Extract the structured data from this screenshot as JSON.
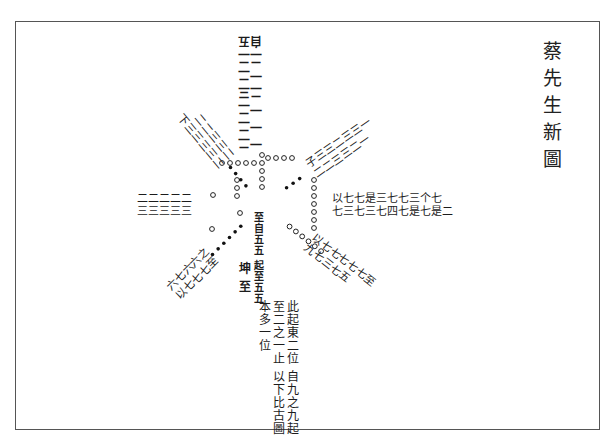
{
  "document": {
    "title": "蔡先生新圖",
    "title_chars": [
      "蔡",
      "先",
      "生",
      "新",
      "圖"
    ],
    "description": "Radial diagram with eight arms of handwritten classical Chinese annotations radiating from a central region marked by rows of circles and dots",
    "arms": [
      {
        "id": "north",
        "direction": "up",
        "marker": "circles",
        "lines": [
          "五二二三二二二",
          "自二一二一一一"
        ]
      },
      {
        "id": "northeast",
        "direction": "up-right",
        "marker": "dots",
        "lines": [
          "子三三二三三一",
          "二二三三二一"
        ]
      },
      {
        "id": "east",
        "direction": "right",
        "marker": "circles",
        "lines": [
          "以七七是三七七三个七",
          "七三七三七四七是七是二"
        ]
      },
      {
        "id": "southeast",
        "direction": "down-right",
        "marker": "circles",
        "lines": [
          "以七七七七七至",
          "九七三七五"
        ]
      },
      {
        "id": "south",
        "direction": "down",
        "marker": "circles",
        "lines": [
          "此起東二位",
          "自九之九起至二之一止",
          "以下比古圖本多一位"
        ]
      },
      {
        "id": "southwest",
        "direction": "down-left",
        "marker": "dots",
        "lines": [
          "以七七七至",
          "六七六六之"
        ]
      },
      {
        "id": "west",
        "direction": "left",
        "marker": "circles",
        "lines": [
          "三三三三三",
          "二二二二二"
        ]
      },
      {
        "id": "northwest",
        "direction": "up-left",
        "marker": "dots",
        "lines": [
          "下三三三三二",
          "二二三三二"
        ]
      }
    ],
    "center_column": {
      "lines": [
        "至自五五",
        "起至五五"
      ],
      "labels": [
        "坤",
        "至",
        "巷"
      ]
    },
    "center_text": {
      "south_main": [
        "此起東二位",
        "自九之九起至二之一止",
        "以下比古圖本多一位"
      ]
    }
  }
}
